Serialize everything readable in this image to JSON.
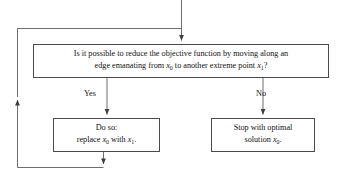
{
  "diagram": {
    "line_color": "#4a4a4a",
    "text_color": "#111111",
    "background": "#ffffff"
  },
  "question_node": {
    "line1": "Is it possible to reduce the objective function by moving along an",
    "line2_part1": "edge emanating from ",
    "line2_var1": "x",
    "line2_sub1": "0",
    "line2_part2": " to another extreme point ",
    "line2_var2": "x",
    "line2_sub2": "1",
    "line2_part3": "?"
  },
  "action_node": {
    "line1": "Do so:",
    "line2_part1": "replace ",
    "line2_var1": "x",
    "line2_sub1": "0",
    "line2_part2": " with ",
    "line2_var2": "x",
    "line2_sub2": "1",
    "line2_part3": "."
  },
  "terminal_node": {
    "line1": "Stop with optimal",
    "line2_part1": "solution ",
    "line2_var1": "x",
    "line2_sub1": "0",
    "line2_part2": "."
  },
  "branches": {
    "yes_label": "Yes",
    "no_label": "No"
  },
  "connectors": {
    "entry_arrow": "entry-arrow-into-question",
    "yes_arrow": "yes-branch-arrow",
    "no_arrow": "no-branch-arrow",
    "loop_return_arrow": "loop-return-arrow",
    "loop_down_arrow": "loop-down-arrow"
  }
}
